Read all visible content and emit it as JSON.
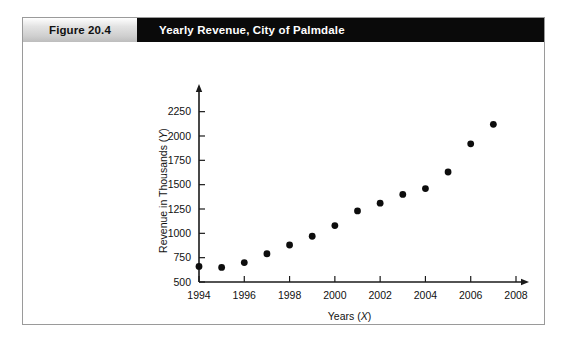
{
  "figure": {
    "number_label": "Figure 20.4",
    "title": "Yearly Revenue, City of Palmdale"
  },
  "chart_data": {
    "type": "scatter",
    "title": "Yearly Revenue, City of Palmdale",
    "xlabel": "Years (X)",
    "xlabel_text": "Years",
    "xlabel_variable": "X",
    "ylabel": "Revenue in Thousands (Y)",
    "ylabel_text": "Revenue in Thousands",
    "ylabel_variable": "Y",
    "x": [
      1994,
      1995,
      1996,
      1997,
      1998,
      1999,
      2000,
      2001,
      2002,
      2003,
      2004,
      2005,
      2006,
      2007
    ],
    "values": [
      660,
      650,
      700,
      790,
      880,
      970,
      1080,
      1230,
      1310,
      1400,
      1460,
      1630,
      1920,
      2120
    ],
    "xlim": [
      1994,
      2008
    ],
    "ylim": [
      500,
      2380
    ],
    "xticks": [
      1994,
      1996,
      1998,
      2000,
      2002,
      2004,
      2006,
      2008
    ],
    "xtick_labels": [
      "1994",
      "1996",
      "1998",
      "2000",
      "2002",
      "2004",
      "2006",
      "2008"
    ],
    "yticks": [
      500,
      750,
      1000,
      1250,
      1500,
      1750,
      2000,
      2250
    ],
    "ytick_labels": [
      "500",
      "750",
      "1000",
      "1250",
      "1500",
      "1750",
      "2000",
      "2250"
    ],
    "grid": false,
    "legend": false,
    "marker_color": "#0d0d0d",
    "axis_color": "#1a1a1a"
  }
}
